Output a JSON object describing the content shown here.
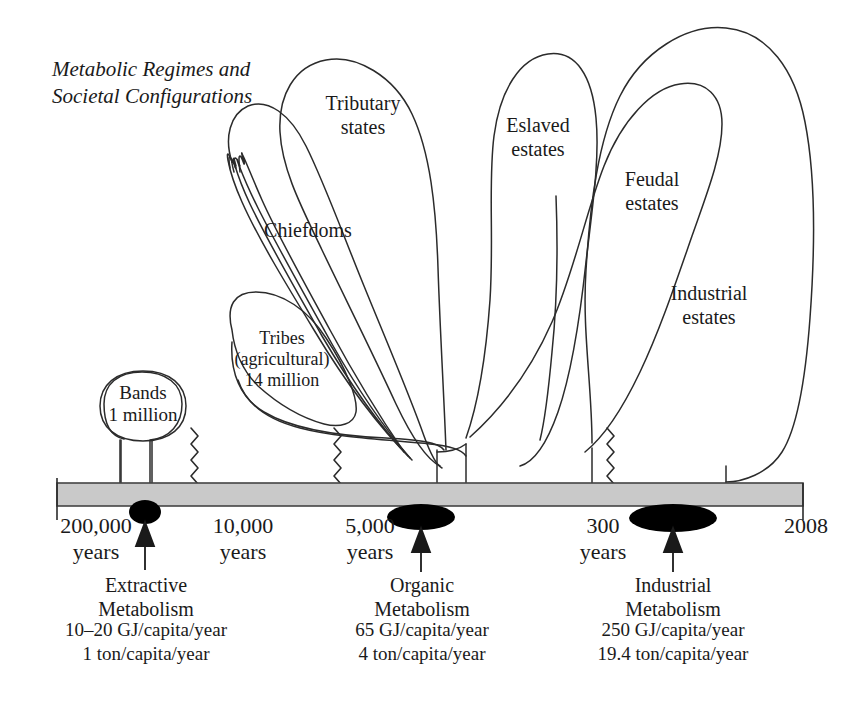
{
  "figure": {
    "title": "Metabolic Regimes and\nSocietal Configurations"
  },
  "canopy_labels": [
    {
      "id": "tributary-states",
      "text": "Tributary\nstates"
    },
    {
      "id": "chiefdoms",
      "text": "Chiefdoms"
    },
    {
      "id": "eslaved-estates",
      "text": "Eslaved\nestates"
    },
    {
      "id": "feudal-estates",
      "text": "Feudal\nestates"
    },
    {
      "id": "industrial-estates",
      "text": "Industrial\nestates"
    },
    {
      "id": "tribes-agricultural",
      "text": "Tribes\n(agricultural)\n14 million"
    },
    {
      "id": "bands",
      "text": "Bands\n1 million"
    }
  ],
  "timeline": {
    "ticks": [
      {
        "id": "tick-200000",
        "text": "200,000\nyears"
      },
      {
        "id": "tick-10000",
        "text": "10,000\nyears"
      },
      {
        "id": "tick-5000",
        "text": "5,000\nyears"
      },
      {
        "id": "tick-300",
        "text": "300\nyears"
      },
      {
        "id": "tick-2008",
        "text": "2008"
      }
    ]
  },
  "regimes": [
    {
      "id": "extractive-metabolism",
      "name": "Extractive\nMetabolism",
      "energy": "10–20 GJ/capita/year",
      "material": "1 ton/capita/year"
    },
    {
      "id": "organic-metabolism",
      "name": "Organic\nMetabolism",
      "energy": "65 GJ/capita/year",
      "material": "4 ton/capita/year"
    },
    {
      "id": "industrial-metabolism",
      "name": "Industrial\nMetabolism",
      "energy": "250 GJ/capita/year",
      "material": "19.4 ton/capita/year"
    }
  ],
  "colors": {
    "ink": "#1a1a1a",
    "stroke": "#2b2b2b",
    "bar_fill": "#c9c9c9",
    "bar_stroke": "#444444",
    "marker_fill": "#000000",
    "background": "#ffffff"
  }
}
